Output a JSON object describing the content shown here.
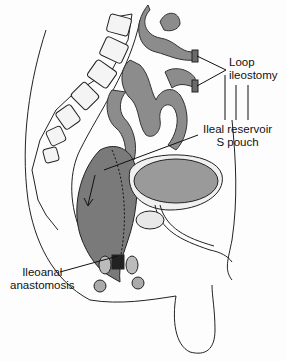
{
  "figure": {
    "type": "anatomical-illustration",
    "view": "sagittal section of male pelvis"
  },
  "labels": {
    "loop_ileostomy": {
      "line1": "Loop",
      "line2": "ileostomy"
    },
    "ileal_reservoir": {
      "line1": "Ileal reservoir",
      "line2": "S pouch"
    },
    "ileoanal_anastomosis": {
      "line1": "Ileoanal",
      "line2": "anastomosis"
    }
  },
  "colors": {
    "bowel_fill": "#8c8c8c",
    "pouch_fill": "#7a7a7a",
    "bladder_fill": "#9a9a9a",
    "outline": "#222222",
    "background": "#fdfdfd"
  }
}
